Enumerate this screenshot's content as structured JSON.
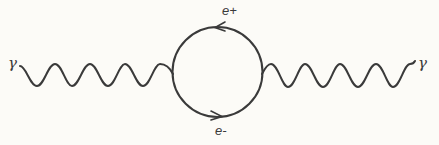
{
  "diagram": {
    "type": "feynman-diagram",
    "line_color": "#3a3a3a",
    "background": "#fcfbf7",
    "labels": {
      "photon_left": "γ",
      "photon_right": "γ",
      "positron": "e+",
      "electron": "e-"
    },
    "loop": {
      "cx": 217.5,
      "cy": 72,
      "r": 45
    },
    "photon_left": {
      "x_start": 20,
      "x_end": 173,
      "periods": 4.5
    },
    "photon_right": {
      "x_start": 262,
      "x_end": 415,
      "periods": 4.5
    },
    "arrows": [
      {
        "position": "top",
        "direction": "left",
        "particle": "e+"
      },
      {
        "position": "bottom",
        "direction": "right",
        "particle": "e-"
      }
    ]
  }
}
